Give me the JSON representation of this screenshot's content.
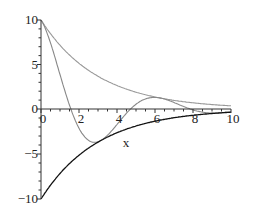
{
  "chart_data": {
    "type": "line",
    "title": "",
    "xlabel": "x",
    "ylabel": "",
    "xlim": [
      0,
      10
    ],
    "ylim": [
      -10,
      10
    ],
    "grid": false,
    "legend": null,
    "x_ticks": [
      "0",
      "2",
      "4",
      "6",
      "8",
      "10"
    ],
    "y_ticks": [
      "10",
      "5",
      "0",
      "-5",
      "-10"
    ],
    "series": [
      {
        "name": "upper envelope",
        "color": "#999999",
        "formula": "10*exp(-x/3)",
        "x": [
          0,
          1,
          2,
          3,
          4,
          5,
          6,
          7,
          8,
          9,
          10
        ],
        "values": [
          10,
          7.17,
          5.13,
          3.68,
          2.64,
          1.89,
          1.35,
          0.97,
          0.69,
          0.5,
          0.36
        ]
      },
      {
        "name": "damped cosine",
        "color": "#888888",
        "formula": "10*exp(-x/3)*cos(x)",
        "x": [
          0,
          0.5,
          1,
          1.57,
          2,
          2.5,
          3,
          3.14,
          3.5,
          4,
          4.5,
          5,
          5.5,
          6,
          6.28,
          6.5,
          7,
          7.5,
          8,
          8.5,
          9,
          9.5,
          10
        ],
        "values": [
          10,
          7.56,
          3.87,
          0,
          -2.13,
          -3.48,
          -3.65,
          -3.51,
          -2.93,
          -1.73,
          -0.47,
          0.54,
          1.13,
          1.3,
          1.23,
          1.12,
          0.73,
          0.3,
          -0.1,
          -0.35,
          -0.46,
          -0.42,
          -0.3
        ]
      },
      {
        "name": "lower envelope",
        "color": "#111111",
        "formula": "-10*exp(-x/3)",
        "x": [
          0,
          1,
          2,
          3,
          4,
          5,
          6,
          7,
          8,
          9,
          10
        ],
        "values": [
          -10,
          -7.17,
          -5.13,
          -3.68,
          -2.64,
          -1.89,
          -1.35,
          -0.97,
          -0.69,
          -0.5,
          -0.36
        ]
      }
    ]
  }
}
